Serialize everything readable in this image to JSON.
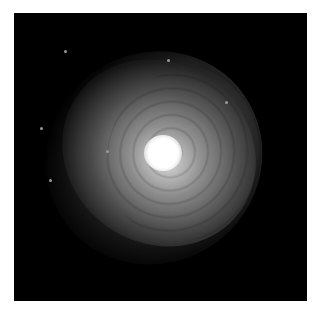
{
  "image": {
    "subject": "galaxy",
    "description": "Grayscale telescope image of a bright elliptical/spiral galaxy with a bright core and faint ring structure on a black background",
    "background_color": "#000000",
    "core_color": "#ffffff"
  },
  "stars": [
    {
      "x": 50,
      "y": 37
    },
    {
      "x": 153,
      "y": 46
    },
    {
      "x": 211,
      "y": 88
    },
    {
      "x": 26,
      "y": 114
    },
    {
      "x": 92,
      "y": 137
    },
    {
      "x": 35,
      "y": 166
    }
  ]
}
